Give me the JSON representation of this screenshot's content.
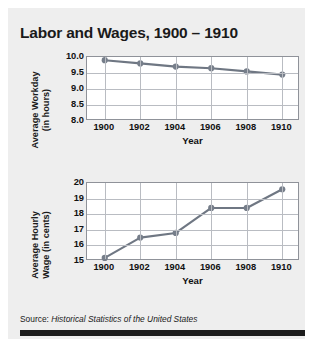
{
  "figure": {
    "title": "Labor and Wages, 1900 – 1910",
    "source_prefix": "Source: ",
    "source_title": "Historical Statistics of the United States"
  },
  "chart_data": [
    {
      "type": "line",
      "title": "",
      "xlabel": "Year",
      "ylabel": "Average Workday\n(in hours)",
      "categories": [
        "1900",
        "1902",
        "1904",
        "1906",
        "1908",
        "1910"
      ],
      "x": [
        1900,
        1902,
        1904,
        1906,
        1908,
        1910
      ],
      "values": [
        9.9,
        9.8,
        9.7,
        9.65,
        9.55,
        9.45
      ],
      "yticks": [
        "8.0",
        "8.5",
        "9.0",
        "9.5",
        "10.0"
      ],
      "ytick_values": [
        8.0,
        8.5,
        9.0,
        9.5,
        10.0
      ],
      "ylim": [
        8.0,
        10.0
      ],
      "xlim": [
        1899,
        1911
      ],
      "grid": true,
      "legend": "none",
      "line_color": "#6f7783",
      "marker_color": "#767e8a"
    },
    {
      "type": "line",
      "title": "",
      "xlabel": "Year",
      "ylabel": "Average Hourly\nWage (in cents)",
      "categories": [
        "1900",
        "1902",
        "1904",
        "1906",
        "1908",
        "1910"
      ],
      "x": [
        1900,
        1902,
        1904,
        1906,
        1908,
        1910
      ],
      "values": [
        15.2,
        16.5,
        16.8,
        18.4,
        18.4,
        19.6
      ],
      "yticks": [
        "15",
        "16",
        "17",
        "18",
        "19",
        "20"
      ],
      "ytick_values": [
        15,
        16,
        17,
        18,
        19,
        20
      ],
      "ylim": [
        15,
        20
      ],
      "xlim": [
        1899,
        1911
      ],
      "grid": true,
      "legend": "none",
      "line_color": "#6f7783",
      "marker_color": "#767e8a"
    }
  ]
}
